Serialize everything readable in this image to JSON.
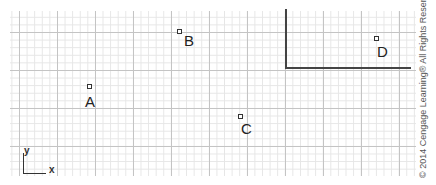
{
  "diagram": {
    "points": [
      {
        "label": "A"
      },
      {
        "label": "B"
      },
      {
        "label": "C"
      },
      {
        "label": "D"
      }
    ],
    "axis": {
      "y_label": "y",
      "x_label": "x"
    },
    "copyright": "© 2014 Cengage Learning® All Rights Reserved."
  }
}
